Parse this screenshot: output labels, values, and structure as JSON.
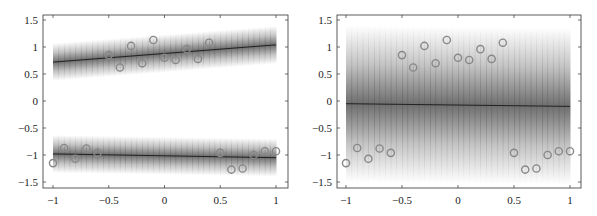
{
  "chart_data": [
    {
      "type": "scatter",
      "title": "",
      "xlabel": "",
      "ylabel": "",
      "xlim": [
        -1.1,
        1.1
      ],
      "ylim": [
        -1.6,
        1.6
      ],
      "grid": false,
      "legend": null,
      "xticks": [
        -1,
        -0.5,
        0,
        0.5,
        1
      ],
      "xtick_labels": [
        "−1",
        "−0.5",
        "0",
        "0.5",
        "1"
      ],
      "yticks": [
        1.5,
        1,
        0.5,
        0,
        -0.5,
        -1,
        -1.5
      ],
      "ytick_labels": [
        "1.5",
        "1",
        "0.5",
        "0",
        "−0.5",
        "−1",
        "−1.5"
      ],
      "series": [
        {
          "name": "data points",
          "marker": "circle",
          "x": [
            -1.0,
            -0.9,
            -0.8,
            -0.7,
            -0.6,
            -0.5,
            -0.4,
            -0.3,
            -0.2,
            -0.1,
            0.0,
            0.1,
            0.2,
            0.3,
            0.4,
            0.5,
            0.6,
            0.7,
            0.8,
            0.9,
            1.0
          ],
          "y": [
            -1.15,
            -0.87,
            -1.07,
            -0.88,
            -0.96,
            0.85,
            0.62,
            1.02,
            0.7,
            1.13,
            0.8,
            0.76,
            0.96,
            0.78,
            1.08,
            -0.96,
            -1.27,
            -1.25,
            -1.0,
            -0.93,
            -0.93
          ]
        },
        {
          "name": "upper mode mean",
          "type": "line",
          "x": [
            -1,
            1
          ],
          "y": [
            0.72,
            1.04
          ],
          "band_halfwidth": 0.35
        },
        {
          "name": "lower mode mean",
          "type": "line",
          "x": [
            -1,
            1
          ],
          "y": [
            -0.98,
            -1.05
          ],
          "band_halfwidth": 0.35
        }
      ]
    },
    {
      "type": "scatter",
      "title": "",
      "xlabel": "",
      "ylabel": "",
      "xlim": [
        -1.1,
        1.1
      ],
      "ylim": [
        -1.6,
        1.6
      ],
      "grid": false,
      "legend": null,
      "xticks": [
        -1,
        -0.5,
        0,
        0.5,
        1
      ],
      "xtick_labels": [
        "−1",
        "−0.5",
        "0",
        "0.5",
        "1"
      ],
      "yticks": [
        1.5,
        1,
        0.5,
        0,
        -0.5,
        -1,
        -1.5
      ],
      "ytick_labels": [
        "1.5",
        "1",
        "0.5",
        "0",
        "−0.5",
        "−1",
        "−1.5"
      ],
      "series": [
        {
          "name": "data points",
          "marker": "circle",
          "x": [
            -1.0,
            -0.9,
            -0.8,
            -0.7,
            -0.6,
            -0.5,
            -0.4,
            -0.3,
            -0.2,
            -0.1,
            0.0,
            0.1,
            0.2,
            0.3,
            0.4,
            0.5,
            0.6,
            0.7,
            0.8,
            0.9,
            1.0
          ],
          "y": [
            -1.15,
            -0.87,
            -1.07,
            -0.88,
            -0.96,
            0.85,
            0.62,
            1.02,
            0.7,
            1.13,
            0.8,
            0.76,
            0.96,
            0.78,
            1.08,
            -0.96,
            -1.27,
            -1.25,
            -1.0,
            -0.93,
            -0.93
          ]
        },
        {
          "name": "unimodal mean",
          "type": "line",
          "x": [
            -1,
            1
          ],
          "y": [
            -0.05,
            -0.1
          ],
          "band_halfwidth": 1.45
        }
      ]
    }
  ],
  "colors": {
    "axis": "#333333",
    "band": "#555555",
    "mean_line": "#222222",
    "marker": "#888888"
  }
}
